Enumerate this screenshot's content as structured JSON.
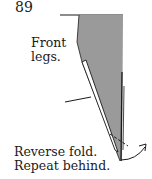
{
  "step": {
    "number": "89"
  },
  "labels": {
    "front_legs_line1": "Front",
    "front_legs_line2": "legs.",
    "instruction_line1": "Reverse fold.",
    "instruction_line2": "Repeat behind."
  },
  "colors": {
    "paper_fill": "#9a9a9a",
    "line": "#1a1a1a",
    "background": "#ffffff"
  }
}
